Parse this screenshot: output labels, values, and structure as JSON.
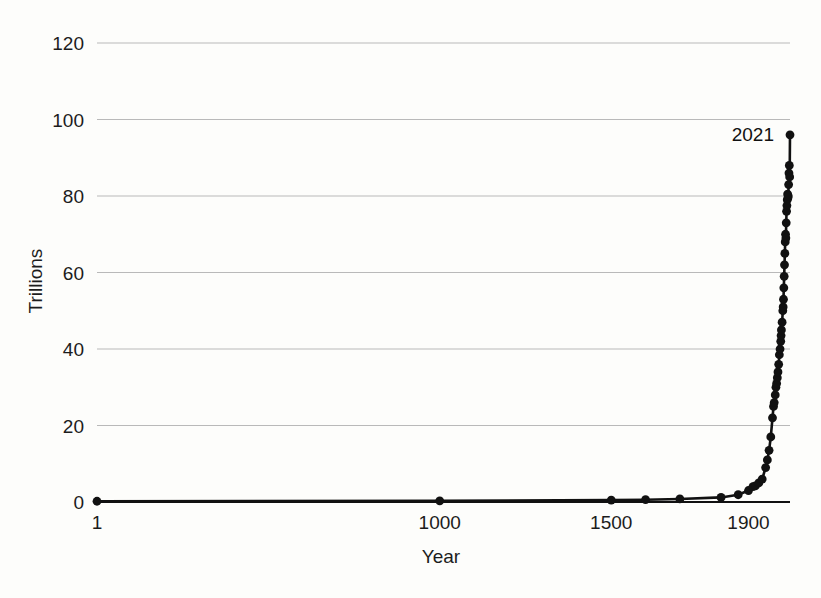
{
  "chart_data": {
    "type": "line",
    "title": "",
    "subtitle": "",
    "xlabel": "Year",
    "ylabel": "Trillions",
    "xlim": [
      1,
      2021
    ],
    "ylim": [
      0,
      120
    ],
    "xticks": [
      1,
      1000,
      1500,
      1900
    ],
    "xtick_labels": [
      "1",
      "1000",
      "1500",
      "1900"
    ],
    "yticks": [
      0,
      20,
      40,
      60,
      80,
      100,
      120
    ],
    "ytick_labels": [
      "0",
      "20",
      "40",
      "60",
      "80",
      "100",
      "120"
    ],
    "grid": "horizontal",
    "legend": "none",
    "markers": "filled-circle",
    "annotations": [
      {
        "text": "2021",
        "x": 2021,
        "y": 96,
        "position": "left-of-point"
      }
    ],
    "series": [
      {
        "name": "World GDP",
        "units": "Trillions",
        "x": [
          1,
          1000,
          1500,
          1600,
          1700,
          1820,
          1870,
          1900,
          1913,
          1920,
          1930,
          1940,
          1950,
          1955,
          1960,
          1965,
          1970,
          1973,
          1975,
          1978,
          1980,
          1982,
          1984,
          1986,
          1988,
          1990,
          1992,
          1994,
          1995,
          1996,
          1998,
          2000,
          2001,
          2002,
          2003,
          2004,
          2005,
          2006,
          2007,
          2008,
          2009,
          2010,
          2011,
          2012,
          2013,
          2014,
          2015,
          2016,
          2017,
          2018,
          2019,
          2020,
          2021
        ],
        "y": [
          0.2,
          0.3,
          0.5,
          0.6,
          0.8,
          1.2,
          1.9,
          3.0,
          4.0,
          4.2,
          5.0,
          6.0,
          9.0,
          11.0,
          13.5,
          17.0,
          22.0,
          25.0,
          26.0,
          28.0,
          30.0,
          31.0,
          32.5,
          34.0,
          36.0,
          38.5,
          40.0,
          42.0,
          43.5,
          45.0,
          47.0,
          50.0,
          51.0,
          53.0,
          56.0,
          59.0,
          62.0,
          65.0,
          68.0,
          70.0,
          69.0,
          73.0,
          76.0,
          77.5,
          79.0,
          80.5,
          79.5,
          80.0,
          83.0,
          86.0,
          88.0,
          85.0,
          96.0
        ]
      }
    ]
  },
  "axes": {
    "y_title": "Trillions",
    "x_title": "Year"
  }
}
